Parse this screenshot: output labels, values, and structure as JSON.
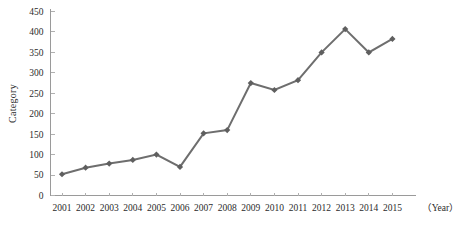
{
  "chart_data": {
    "type": "line",
    "title": "",
    "xlabel": "（Year）",
    "ylabel": "Category",
    "categories": [
      "2001",
      "2002",
      "2003",
      "2004",
      "2005",
      "2006",
      "2007",
      "2008",
      "2009",
      "2010",
      "2011",
      "2012",
      "2013",
      "2014",
      "2015"
    ],
    "values": [
      52,
      68,
      78,
      87,
      100,
      70,
      152,
      160,
      275,
      258,
      282,
      350,
      407,
      350,
      383
    ],
    "series": [
      {
        "name": "Category",
        "values": [
          52,
          68,
          78,
          87,
          100,
          70,
          152,
          160,
          275,
          258,
          282,
          350,
          407,
          350,
          383
        ]
      }
    ],
    "ylim": [
      0,
      450
    ],
    "ytick_labels": [
      "0",
      "50",
      "100",
      "150",
      "200",
      "250",
      "300",
      "350",
      "400",
      "450"
    ],
    "ytick_values": [
      0,
      50,
      100,
      150,
      200,
      250,
      300,
      350,
      400,
      450
    ],
    "xtick_labels": [
      "2001",
      "2002",
      "2003",
      "2004",
      "2005",
      "2006",
      "2007",
      "2008",
      "2009",
      "2010",
      "2011",
      "2012",
      "2013",
      "2014",
      "2015"
    ],
    "grid": false,
    "legend": "none",
    "marker": "diamond",
    "line_color": "#6e6e6e",
    "marker_color": "#5f5f5f",
    "axis_color": "#9a9a9a",
    "text_color": "#2b2b2b",
    "background_color": "#ffffff"
  }
}
